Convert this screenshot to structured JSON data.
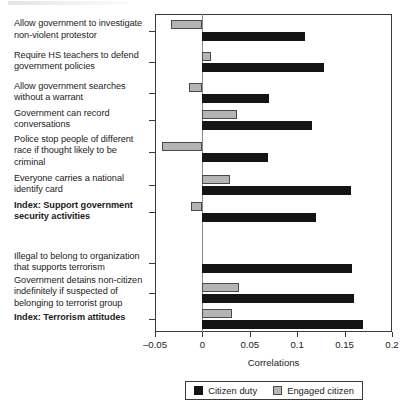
{
  "chart_data": {
    "type": "bar",
    "orientation": "horizontal",
    "title": "",
    "xlabel": "Correlations",
    "ylabel": "",
    "xlim": [
      -0.05,
      0.2
    ],
    "xticks": [
      "–0.05",
      "0",
      "0.05",
      "0.1",
      "0.15",
      "0.2"
    ],
    "xtick_values": [
      -0.05,
      0,
      0.05,
      0.1,
      0.15,
      0.2
    ],
    "grid": false,
    "legend_position": "bottom",
    "categories": [
      "Allow government to investigate non-violent protestor",
      "Require HS teachers to defend government policies",
      "Allow government searches without a warrant",
      "Government can record conversations",
      "Police stop people of different race if thought likely to be criminal",
      "Everyone carries a national identify card",
      "Index: Support government security activities",
      "Illegal to belong to organization that supports terrorism",
      "Government detains non-citizen indefinitely if suspected of belonging to terrorist group",
      "Index: Terrorism attitudes"
    ],
    "series": [
      {
        "name": "Citizen duty",
        "color": "#141414",
        "values": [
          0.108,
          0.128,
          0.07,
          0.116,
          0.069,
          0.157,
          0.12,
          0.158,
          0.16,
          0.169
        ]
      },
      {
        "name": "Engaged citizen",
        "color": "#b4b4b2",
        "values": [
          -0.033,
          0.009,
          -0.014,
          0.037,
          -0.043,
          0.029,
          -0.012,
          0.0,
          0.039,
          0.031
        ]
      }
    ]
  },
  "categories_display": [
    {
      "lines": [
        "Allow government to investigate",
        "non-violent protestor"
      ],
      "bold": false
    },
    {
      "lines": [
        "Require HS teachers to defend",
        "government policies"
      ],
      "bold": false
    },
    {
      "lines": [
        "Allow government searches",
        "without a warrant"
      ],
      "bold": false
    },
    {
      "lines": [
        "Government can record",
        "conversations"
      ],
      "bold": false
    },
    {
      "lines": [
        "Police stop people of different",
        "race if thought likely to be",
        "criminal"
      ],
      "bold": false
    },
    {
      "lines": [
        "Everyone carries a national",
        "identify card"
      ],
      "bold": false
    },
    {
      "lines": [
        "Index: Support government",
        "security activities"
      ],
      "bold": true
    },
    {
      "lines": [
        "Illegal to belong to organization",
        "that supports terrorism"
      ],
      "bold": false
    },
    {
      "lines": [
        "Government detains non-citizen",
        "indefinitely if suspected of",
        "belonging to terrorist group"
      ],
      "bold": false
    },
    {
      "lines": [
        "Index: Terrorism attitudes"
      ],
      "bold": true
    }
  ],
  "axis": {
    "x_title": "Correlations"
  },
  "legend": {
    "entries": [
      {
        "label": "Citizen duty",
        "swatch": "duty"
      },
      {
        "label": "Engaged citizen",
        "swatch": "engaged"
      }
    ]
  }
}
